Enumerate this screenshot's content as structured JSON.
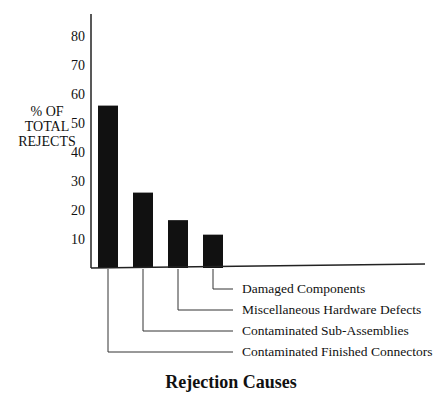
{
  "chart_data": {
    "type": "bar",
    "title": "Rejection Causes",
    "xlabel": "Rejection Causes",
    "ylabel": [
      "% OF",
      "TOTAL",
      "REJECTS"
    ],
    "categories": [
      "Contaminated Finished Connectors",
      "Contaminated Sub-Assemblies",
      "Miscellaneous Hardware Defects",
      "Damaged Components"
    ],
    "values": [
      56,
      26,
      16.5,
      11.5
    ],
    "yticks": [
      10,
      20,
      30,
      40,
      50,
      60,
      70,
      80
    ],
    "ylim": [
      0,
      88
    ],
    "grid": false,
    "legend": null,
    "bar_color": "#111111"
  }
}
